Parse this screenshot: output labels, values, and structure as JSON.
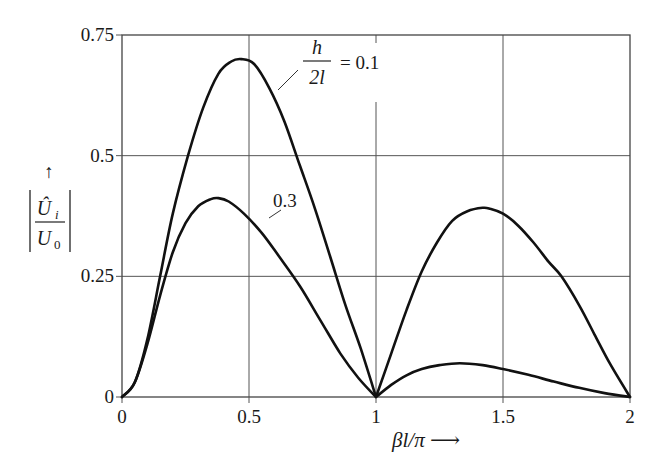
{
  "chart_data": {
    "type": "line",
    "title": "",
    "xlabel": "βl/π ⟶",
    "ylabel": "|Û_i / U_0| ↑",
    "xlim": [
      0,
      2
    ],
    "ylim": [
      0,
      0.75
    ],
    "grid": true,
    "legend_position": "inline annotations",
    "x_ticks": [
      "0",
      "0.5",
      "1",
      "1.5",
      "2"
    ],
    "y_ticks": [
      "0",
      "0.25",
      "0.5",
      "0.75"
    ],
    "series": [
      {
        "name": "h/2l = 0.1",
        "x": [
          0,
          0.05,
          0.1,
          0.15,
          0.2,
          0.26,
          0.32,
          0.38,
          0.43,
          0.47,
          0.52,
          0.58,
          0.64,
          0.7,
          0.76,
          0.82,
          0.88,
          0.94,
          1.0,
          1.06,
          1.12,
          1.18,
          1.24,
          1.3,
          1.36,
          1.42,
          1.45,
          1.5,
          1.56,
          1.62,
          1.68,
          1.73,
          1.8,
          1.86,
          1.92,
          2.0
        ],
        "y": [
          0,
          0.03,
          0.12,
          0.25,
          0.38,
          0.5,
          0.6,
          0.67,
          0.695,
          0.7,
          0.69,
          0.64,
          0.57,
          0.48,
          0.39,
          0.29,
          0.19,
          0.1,
          0,
          0.09,
          0.18,
          0.26,
          0.32,
          0.365,
          0.385,
          0.392,
          0.39,
          0.38,
          0.355,
          0.32,
          0.28,
          0.25,
          0.19,
          0.13,
          0.07,
          0
        ]
      },
      {
        "name": "h/2l = 0.3",
        "x": [
          0,
          0.05,
          0.1,
          0.15,
          0.2,
          0.25,
          0.3,
          0.35,
          0.38,
          0.42,
          0.48,
          0.55,
          0.62,
          0.7,
          0.78,
          0.86,
          0.93,
          1.0,
          1.06,
          1.12,
          1.18,
          1.25,
          1.33,
          1.42,
          1.5,
          1.6,
          1.7,
          1.8,
          1.9,
          2.0
        ],
        "y": [
          0,
          0.03,
          0.11,
          0.21,
          0.3,
          0.36,
          0.395,
          0.41,
          0.412,
          0.405,
          0.38,
          0.34,
          0.29,
          0.23,
          0.16,
          0.09,
          0.04,
          0,
          0.025,
          0.045,
          0.058,
          0.066,
          0.07,
          0.066,
          0.058,
          0.046,
          0.032,
          0.019,
          0.008,
          0
        ]
      }
    ],
    "annotations": [
      {
        "text_num": "h",
        "text_den": "2l",
        "text_rhs": "= 0.1",
        "points_to": "h/2l = 0.1 curve"
      },
      {
        "text": "0.3",
        "points_to": "h/2l = 0.3 curve"
      }
    ]
  },
  "labels": {
    "x_axis_label": "βl/π ⟶",
    "y_axis_arrow": "↑",
    "y_axis_num": "Û",
    "y_axis_num_sub": "i",
    "y_axis_den": "U",
    "y_axis_den_sub": "0",
    "anno1_num": "h",
    "anno1_den": "2l",
    "anno1_rhs": "= 0.1",
    "anno2": "0.3"
  },
  "colors": {
    "curve": "#111111",
    "grid": "#555555",
    "background": "#ffffff"
  }
}
